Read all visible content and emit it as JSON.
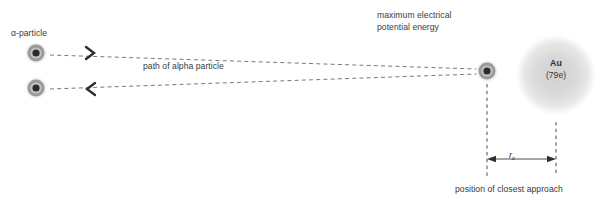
{
  "diagram": {
    "background_color": "#ffffff",
    "labels": {
      "alpha_particle": "α-particle",
      "path_of_alpha_particle": "path of alpha particle",
      "maximum_energy_line1": "maximum electrical",
      "maximum_energy_line2": "potential energy",
      "position_of_closest_approach": "position of closest approach",
      "gold_symbol": "Au",
      "gold_charge": "(79e)",
      "distance_symbol": "r",
      "distance_subscript": "c"
    },
    "colors": {
      "text": "#3a3a3a",
      "line": "#6e6e6e",
      "particle_core": "#2b2b2b",
      "particle_ring": "#8d8d8d",
      "particle_halo": "#c9c9c9",
      "gold_atom": "#d9d9d9"
    },
    "particles": [
      {
        "name": "incoming-alpha-particle",
        "cx": 36,
        "cy": 53,
        "r": 9
      },
      {
        "name": "outgoing-alpha-particle",
        "cx": 36,
        "cy": 88,
        "r": 9
      },
      {
        "name": "turning-point-alpha-particle",
        "cx": 487,
        "cy": 71,
        "r": 9
      }
    ],
    "gold_atom": {
      "name": "gold-nucleus-atom",
      "cx": 556,
      "cy": 75,
      "r": 40
    },
    "paths": [
      {
        "name": "incoming-path",
        "x1": 50,
        "y1": 55,
        "x2": 477,
        "y2": 69,
        "direction": "right"
      },
      {
        "name": "outgoing-path",
        "x1": 50,
        "y1": 89,
        "x2": 477,
        "y2": 74,
        "direction": "left"
      }
    ],
    "measurement": {
      "name": "closest-approach-distance",
      "left_x": 487,
      "right_x": 556,
      "arrow_y": 159,
      "guide_top_left": 84,
      "guide_bottom_left": 176,
      "guide_top_right": 122,
      "guide_bottom_right": 176
    }
  }
}
